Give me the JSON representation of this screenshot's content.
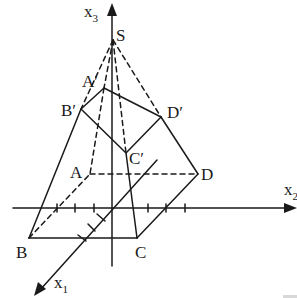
{
  "diagram": {
    "colors": {
      "stroke": "#1a1a1a",
      "background": "#ffffff"
    },
    "axes": [
      {
        "name": "x1",
        "base": "x",
        "subscript": "1"
      },
      {
        "name": "x2",
        "base": "x",
        "subscript": "2"
      },
      {
        "name": "x3",
        "base": "x",
        "subscript": "3"
      }
    ],
    "points": {
      "S": "S",
      "A_prime": "A′",
      "B_prime": "B′",
      "C_prime": "C′",
      "D_prime": "D′",
      "A": "A",
      "B": "B",
      "C": "C",
      "D": "D"
    }
  }
}
